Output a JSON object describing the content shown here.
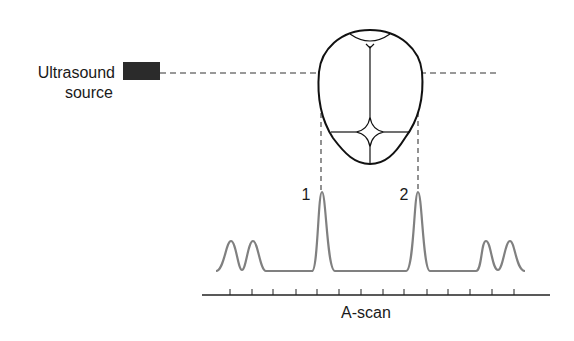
{
  "source": {
    "label_line1": "Ultrasound",
    "label_line2": "source",
    "color": "#2b2b2b"
  },
  "echoes": {
    "peak1_label": "1",
    "peak2_label": "2"
  },
  "axis": {
    "label": "A-scan",
    "tick_count": 14
  },
  "colors": {
    "outline": "#111111",
    "dashed": "#777777",
    "trace": "#808080",
    "axis": "#222222"
  }
}
